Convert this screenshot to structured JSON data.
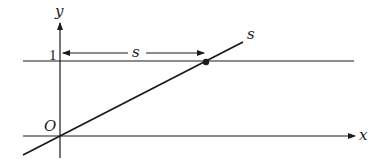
{
  "diagram": {
    "labels": {
      "y_axis": "y",
      "x_axis": "x",
      "origin": "O",
      "one": "1",
      "horizontal_distance": "s",
      "line_label": "s"
    },
    "colors": {
      "stroke": "#1a1a1a",
      "background": "#ffffff"
    },
    "elements": {
      "y_axis": {
        "x": 60,
        "y_from": 158,
        "y_to": 22
      },
      "x_axis": {
        "y": 136,
        "x_from": 23,
        "x_to": 356
      },
      "horizontal_line_y1": {
        "y": 61,
        "x_from": 23,
        "x_to": 354
      },
      "diagonal_line": {
        "from": [
          23,
          155
        ],
        "to": [
          243,
          42
        ]
      },
      "intersection_point": [
        206,
        62
      ],
      "s_arrow": {
        "y": 53,
        "x_from": 62,
        "x_to": 205
      }
    }
  }
}
